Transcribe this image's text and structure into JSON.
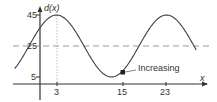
{
  "chart_data": {
    "type": "line",
    "title": "",
    "xlabel": "x",
    "ylabel": "d(x)",
    "function": "d(x) = 25 + 20*cos(pi*(x-3)/10)",
    "x_ticks": [
      3,
      15,
      23
    ],
    "y_ticks": [
      5,
      25,
      45
    ],
    "x": [
      -4.6,
      -2,
      0,
      3,
      6,
      8,
      10,
      13,
      15,
      18,
      20,
      23,
      26,
      28.5
    ],
    "y": [
      10.3,
      19.1,
      37.6,
      45,
      41.2,
      25,
      13.2,
      5,
      6.9,
      25,
      36.8,
      45,
      41.2,
      31.5
    ],
    "reference_lines": [
      {
        "y": 25,
        "style": "dashed"
      }
    ],
    "annotations": [
      {
        "x": 15,
        "y": 6.9,
        "text": "Increasing",
        "marker": "square"
      }
    ],
    "grid": false,
    "xlim": [
      -4.6,
      28.5
    ],
    "ylim": [
      0,
      48
    ]
  },
  "labels": {
    "y_axis": "d(x)",
    "x_axis": "x",
    "tick_45": "45",
    "tick_25": "25",
    "tick_5": "5",
    "tick_3": "3",
    "tick_15": "15",
    "tick_23": "23",
    "annotation": "Increasing"
  }
}
